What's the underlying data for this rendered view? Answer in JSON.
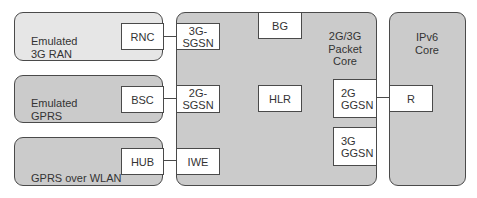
{
  "regions": {
    "emulated_3g_ran": {
      "label": "Emulated\n3G RAN"
    },
    "emulated_gprs": {
      "label": "Emulated\nGPRS"
    },
    "gprs_over_wlan": {
      "label": "GPRS over WLAN"
    },
    "packet_core": {
      "label": "2G/3G\nPacket\nCore"
    },
    "ipv6_core": {
      "label": "IPv6\nCore"
    }
  },
  "nodes": {
    "rnc": "RNC",
    "bsc": "BSC",
    "hub": "HUB",
    "sgsn_3g": "3G-\nSGSN",
    "sgsn_2g": "2G-\nSGSN",
    "iwe": "IWE",
    "bg": "BG",
    "hlr": "HLR",
    "ggsn_2g": "2G\nGGSN",
    "ggsn_3g": "3G\nGGSN",
    "r": "R"
  },
  "links": [
    {
      "from": "RNC",
      "to": "3G-SGSN"
    },
    {
      "from": "BSC",
      "to": "2G-SGSN"
    },
    {
      "from": "HUB",
      "to": "IWE"
    },
    {
      "from": "2G GGSN",
      "to": "R"
    }
  ],
  "colors": {
    "light_region": "#e6e6e6",
    "mid_region": "#cbcbcb",
    "border": "#4a4a4a"
  }
}
